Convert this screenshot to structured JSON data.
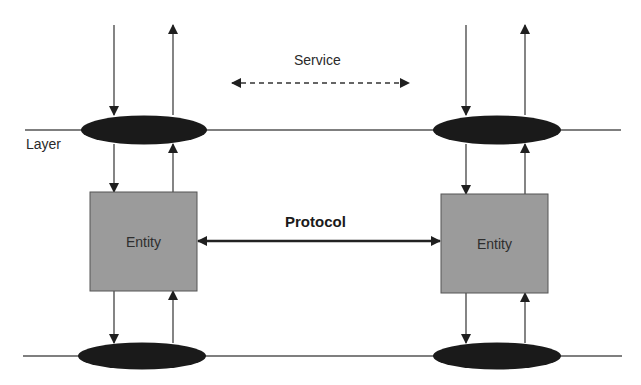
{
  "diagram": {
    "type": "layered-protocol-architecture",
    "labels": {
      "layer": "Layer",
      "service": "Service",
      "protocol": "Protocol"
    },
    "entities": [
      {
        "id": "left",
        "label": "Entity"
      },
      {
        "id": "right",
        "label": "Entity"
      }
    ],
    "nodes": {
      "service_access_points": [
        "upper-left",
        "upper-right",
        "lower-left",
        "lower-right"
      ]
    },
    "edges": [
      {
        "from": "left-entity",
        "to": "right-entity",
        "label": "Protocol",
        "style": "solid-bidirectional"
      },
      {
        "from": "upper-left-sap",
        "to": "upper-right-sap",
        "label": "Service",
        "style": "dashed-bidirectional"
      }
    ],
    "colors": {
      "entity_fill": "#9b9b9b",
      "sap_fill": "#1a1a1a",
      "line": "#444444"
    }
  }
}
